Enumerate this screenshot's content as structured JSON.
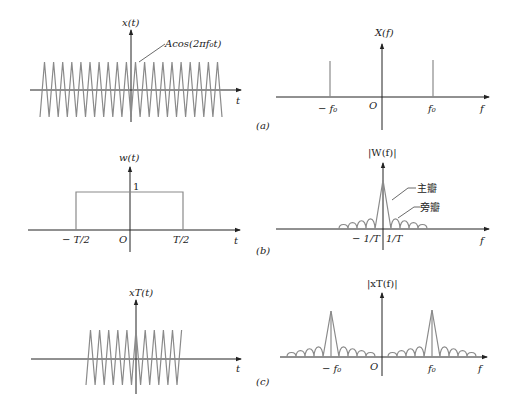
{
  "figure": {
    "panels": [
      {
        "id": "a",
        "caption": "(a)",
        "time_domain": {
          "ylabel": "x(t)",
          "xlabel": "t",
          "annotation": "Acos(2πf₀t)",
          "signal": "cosine, infinite extent"
        },
        "freq_domain": {
          "ylabel": "X(f)",
          "xlabel": "f",
          "ticks": [
            "-f₀",
            "O",
            "f₀"
          ],
          "signal": "two impulses at ±f₀"
        }
      },
      {
        "id": "b",
        "caption": "(b)",
        "time_domain": {
          "ylabel": "w(t)",
          "xlabel": "t",
          "level_label": "1",
          "ticks": [
            "-T/2",
            "O",
            "T/2"
          ],
          "signal": "rectangular window"
        },
        "freq_domain": {
          "ylabel": "|W(f)|",
          "xlabel": "f",
          "ticks": [
            "-1/T",
            "1/T"
          ],
          "main_lobe_label": "主瓣",
          "side_lobe_label": "旁瓣",
          "signal": "sinc magnitude"
        }
      },
      {
        "id": "c",
        "caption": "(c)",
        "time_domain": {
          "ylabel": "x_T(t)",
          "xlabel": "t",
          "signal": "truncated cosine"
        },
        "freq_domain": {
          "ylabel": "|x_T(f)|",
          "xlabel": "f",
          "ticks": [
            "-f₀",
            "O",
            "f₀"
          ],
          "signal": "sinc shifted to ±f₀"
        }
      }
    ],
    "colors": {
      "axis": "#222222",
      "signal": "#8a8a8a",
      "background": "#ffffff"
    }
  },
  "text": {
    "a_xt": "x(t)",
    "a_t": "t",
    "a_ann": "Acos(2πf₀t)",
    "a_Xf": "X(f)",
    "a_f": "f",
    "a_mf0": "− f₀",
    "a_O": "O",
    "a_f0": "f₀",
    "a_cap": "(a)",
    "b_wt": "w(t)",
    "b_t": "t",
    "b_one": "1",
    "b_mT2": "− T/2",
    "b_O": "O",
    "b_T2": "T/2",
    "b_Wf": "|W(f)|",
    "b_f": "f",
    "b_m1T": "− 1/T",
    "b_1T": "1/T",
    "b_main": "主瓣",
    "b_side": "旁瓣",
    "b_cap": "(b)",
    "c_xt": "xT(t)",
    "c_t": "t",
    "c_Xf": "|xT(f)|",
    "c_f": "f",
    "c_mf0": "− f₀",
    "c_O": "O",
    "c_f0": "f₀",
    "c_cap": "(c)"
  }
}
